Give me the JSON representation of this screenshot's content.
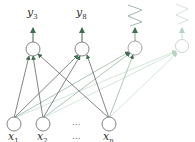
{
  "diagram": {
    "type": "neural-network",
    "outputs": [
      {
        "base": "y",
        "sub": "3",
        "x": 33,
        "y": 49,
        "style": "label"
      },
      {
        "base": "y",
        "sub": "8",
        "x": 82,
        "y": 49,
        "style": "label"
      },
      {
        "base": "",
        "sub": "",
        "x": 135,
        "y": 48,
        "style": "zigzag"
      },
      {
        "base": "",
        "sub": "",
        "x": 182,
        "y": 46,
        "style": "zigzag-faded"
      }
    ],
    "inputs": [
      {
        "base": "x",
        "sub": "1",
        "x": 14,
        "y": 124
      },
      {
        "base": "x",
        "sub": "2",
        "x": 43,
        "y": 124
      },
      {
        "base": "x",
        "sub": "n",
        "x": 109,
        "y": 124
      }
    ],
    "ellipsis": "...",
    "colors": {
      "edge": "#4a7a5a",
      "edge_faded": "#b5d3c0",
      "node": "#666666"
    }
  }
}
